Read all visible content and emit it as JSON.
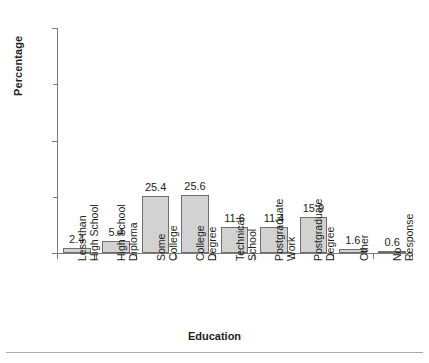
{
  "chart_data": {
    "type": "bar",
    "title": "",
    "xlabel": "Education",
    "ylabel": "Percentage",
    "categories": [
      "Less than High School",
      "High School Diploma",
      "Some College",
      "College Degree",
      "Technical School",
      "Postgraduate Work",
      "Postgraduate Degree",
      "Other",
      "No Response"
    ],
    "category_lines": [
      [
        "Less than",
        "High School"
      ],
      [
        "High School",
        "Diploma"
      ],
      [
        "Some",
        "College"
      ],
      [
        "College",
        "Degree"
      ],
      [
        "Technical",
        "School"
      ],
      [
        "Postgraduate",
        "Work"
      ],
      [
        "Postgraduate",
        "Degree"
      ],
      [
        "Other"
      ],
      [
        "No",
        "Response"
      ]
    ],
    "values": [
      2.4,
      5.4,
      25.4,
      25.6,
      11.6,
      11.4,
      15.9,
      1.6,
      0.6
    ],
    "value_labels": [
      "2.4",
      "5.4",
      "25.4",
      "25.6",
      "11.6",
      "11.4",
      "15.9",
      "1.6",
      "0.6"
    ],
    "ylim": [
      0,
      100
    ],
    "ytick_labels": [
      "0",
      "50",
      "100"
    ],
    "ytick_values": [
      0,
      50,
      100
    ],
    "yminor_tick_values": [
      25,
      75
    ],
    "grid": false,
    "legend": false,
    "bar_fill_color": "#d2d2d2",
    "bar_border_color": "#6f6f6f",
    "axis_color": "#7b7b7b",
    "text_color": "#231f20"
  }
}
